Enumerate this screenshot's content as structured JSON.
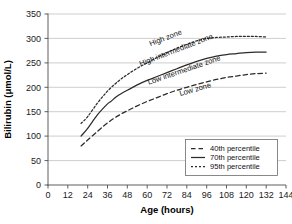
{
  "chart_data": {
    "type": "line",
    "title": "",
    "xlabel": "Age (hours)",
    "ylabel": "Bilirubin (μmol/L)",
    "xlim": [
      0,
      144
    ],
    "ylim": [
      0,
      350
    ],
    "xticks": [
      0,
      12,
      24,
      36,
      48,
      60,
      72,
      84,
      96,
      108,
      120,
      132,
      144
    ],
    "yticks": [
      0,
      50,
      100,
      150,
      200,
      250,
      300,
      350
    ],
    "xtick_labels": [
      "0",
      "12",
      "24",
      "36",
      "48",
      "60",
      "72",
      "84",
      "96",
      "108",
      "120",
      "132",
      "144"
    ],
    "ytick_labels": [
      "0",
      "50",
      "100",
      "150",
      "200",
      "250",
      "300",
      "350"
    ],
    "grid": "horizontal",
    "legend_position": "lower-right",
    "series": [
      {
        "name": "40th percentile",
        "style": "dashed",
        "color": "#2b2b2b",
        "x": [
          20,
          24,
          30,
          36,
          42,
          48,
          54,
          60,
          66,
          72,
          78,
          84,
          90,
          96,
          102,
          108,
          114,
          120,
          126,
          132
        ],
        "y": [
          80,
          92,
          110,
          127,
          141,
          152,
          162,
          171,
          179,
          187,
          194,
          200,
          206,
          211,
          216,
          220,
          223,
          226,
          228,
          229
        ]
      },
      {
        "name": "70th percentile",
        "style": "solid",
        "color": "#2b2b2b",
        "x": [
          20,
          24,
          30,
          36,
          38,
          42,
          48,
          54,
          60,
          66,
          72,
          78,
          84,
          90,
          96,
          102,
          108,
          114,
          120,
          126,
          132
        ],
        "y": [
          100,
          116,
          144,
          166,
          171,
          182,
          194,
          205,
          214,
          222,
          230,
          238,
          246,
          253,
          259,
          264,
          267,
          269,
          271,
          272,
          272
        ]
      },
      {
        "name": "95th percentile",
        "style": "dotted",
        "color": "#2b2b2b",
        "x": [
          20,
          24,
          30,
          36,
          42,
          48,
          54,
          60,
          66,
          72,
          78,
          84,
          90,
          96,
          102,
          108,
          114,
          120,
          126,
          132
        ],
        "y": [
          126,
          140,
          168,
          192,
          211,
          226,
          239,
          250,
          261,
          271,
          280,
          288,
          295,
          300,
          302,
          303,
          304,
          304,
          304,
          303
        ]
      }
    ],
    "annotations": [
      {
        "text": "High zone",
        "x": 62,
        "y": 284,
        "rotation": -21
      },
      {
        "text": "High intermediate zone",
        "x": 56,
        "y": 243,
        "rotation": -21
      },
      {
        "text": "Low intermediate zone",
        "x": 61,
        "y": 205,
        "rotation": -19
      },
      {
        "text": "Low zone",
        "x": 80,
        "y": 182,
        "rotation": -16
      }
    ],
    "legend_entries": [
      {
        "label": "40th percentile",
        "style": "dashed"
      },
      {
        "label": "70th percentile",
        "style": "solid"
      },
      {
        "label": "95th percentile",
        "style": "dotted"
      }
    ]
  }
}
